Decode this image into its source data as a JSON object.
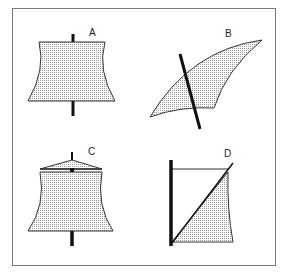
{
  "figure": {
    "panels": [
      {
        "id": "A",
        "label": "A",
        "type": "square sail with concave sides, mast centered"
      },
      {
        "id": "B",
        "label": "B",
        "type": "curved lateen-style sail crossing a slanted mast"
      },
      {
        "id": "C",
        "label": "C",
        "type": "square sail with triangular top rigging, mast centered"
      },
      {
        "id": "D",
        "label": "D",
        "type": "sprit-like triangular sail beside vertical mast with diagonal spar"
      }
    ]
  },
  "colors": {
    "frame": "#7a7a7a",
    "outline": "#333333",
    "mast": "#111111",
    "fill_dots": "#9a9a9a",
    "background": "#ffffff"
  }
}
